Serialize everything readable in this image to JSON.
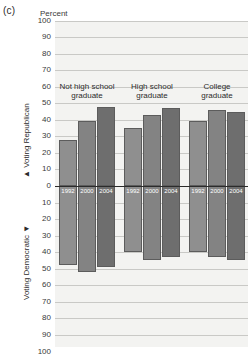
{
  "figure": {
    "panel_label": "(c)",
    "percent_label": "Percent",
    "axis_top_caption": "Voting Republican",
    "axis_top_arrow": "▲",
    "axis_bottom_caption": "Voting Democratic",
    "axis_bottom_arrow": "▼"
  },
  "chart_data": {
    "type": "bar",
    "title": "",
    "subtitle": "",
    "xlabel": "",
    "ylabel": "Percent",
    "ylim": [
      -100,
      100
    ],
    "y_ticks": [
      100,
      90,
      80,
      70,
      60,
      50,
      40,
      30,
      20,
      10,
      0,
      10,
      20,
      30,
      40,
      50,
      60,
      70,
      80,
      90,
      100
    ],
    "grid": true,
    "legend": "none",
    "orientation": "diverging-vertical",
    "upper_half_meaning": "Voting Republican",
    "lower_half_meaning": "Voting Democratic",
    "categories": [
      "Not high school graduate",
      "High school graduate",
      "College graduate"
    ],
    "x": [
      "1992",
      "2000",
      "2004"
    ],
    "series": [
      {
        "name": "Voting Republican",
        "group_values": [
          [
            28,
            39,
            48
          ],
          [
            35,
            43,
            47
          ],
          [
            39,
            46,
            45
          ]
        ]
      },
      {
        "name": "Voting Democratic",
        "group_values": [
          [
            48,
            52,
            49
          ],
          [
            40,
            45,
            43
          ],
          [
            40,
            43,
            45
          ]
        ]
      }
    ],
    "groups": [
      {
        "label": "Not high school\ngraduate",
        "bars": [
          {
            "year": "1992",
            "republican": 28,
            "democratic": 48
          },
          {
            "year": "2000",
            "republican": 39,
            "democratic": 52
          },
          {
            "year": "2004",
            "republican": 48,
            "democratic": 49
          }
        ]
      },
      {
        "label": "High school\ngraduate",
        "bars": [
          {
            "year": "1992",
            "republican": 35,
            "democratic": 40
          },
          {
            "year": "2000",
            "republican": 43,
            "democratic": 45
          },
          {
            "year": "2004",
            "republican": 47,
            "democratic": 43
          }
        ]
      },
      {
        "label": "College\ngraduate",
        "bars": [
          {
            "year": "1992",
            "republican": 39,
            "democratic": 40
          },
          {
            "year": "2000",
            "republican": 46,
            "democratic": 43
          },
          {
            "year": "2004",
            "republican": 45,
            "democratic": 45
          }
        ]
      }
    ],
    "colors": {
      "plot_background": "#f3f3f1",
      "gridline": "#c9c9c6",
      "zeroline": "#2b2b2b",
      "bar_1992": "#8f8f8f",
      "bar_2000": "#838383",
      "bar_2004": "#6e6e6e",
      "bar_outline": "#5c5c5c",
      "text": "#2b2b2b"
    }
  }
}
